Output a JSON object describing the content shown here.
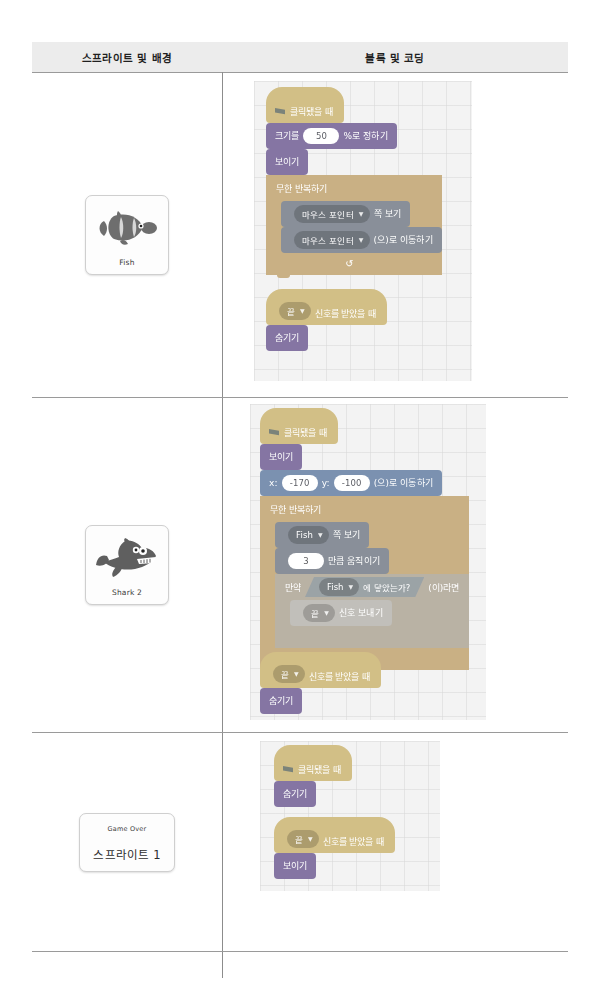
{
  "table": {
    "headers": [
      "스프라이트 및 배경",
      "블록 및 코딩"
    ]
  },
  "palette": {
    "events": "#ffbf00",
    "looks": "#9966ff",
    "motion": "#4c97ff",
    "control": "#ffab19",
    "sensing": "#5cb1d6",
    "flag_green": "#45993d",
    "canvas_bg": "#f3f3f3",
    "header_bg": "#ececec",
    "rule": "#9a9a9a"
  },
  "rows": [
    {
      "sprite": {
        "name": "Fish",
        "thumb_icon": "clownfish-icon"
      },
      "scripts": [
        {
          "id": "fish-main",
          "blocks": [
            {
              "kind": "hat",
              "cat": "events",
              "icon": "green-flag-icon",
              "text": "클릭됐을 때"
            },
            {
              "kind": "stack",
              "cat": "looks",
              "pre": "크기를",
              "input": "50",
              "post": "%로 정하기"
            },
            {
              "kind": "stack",
              "cat": "looks",
              "pre": "보이기"
            },
            {
              "kind": "c",
              "cat": "control",
              "text": "무한 반복하기",
              "arrow": "loop-arrow-icon",
              "children": [
                {
                  "kind": "stack",
                  "cat": "motion",
                  "dropdown": "마우스 포인터",
                  "post": "쪽 보기"
                },
                {
                  "kind": "stack",
                  "cat": "motion",
                  "dropdown": "마우스 포인터",
                  "post": "(으)로 이동하기"
                }
              ]
            }
          ]
        },
        {
          "id": "fish-receive",
          "blocks": [
            {
              "kind": "hat",
              "cat": "events",
              "dropdown": "끝",
              "post": "신호를 받았을 때"
            },
            {
              "kind": "stack",
              "cat": "looks",
              "pre": "숨기기"
            }
          ]
        }
      ]
    },
    {
      "sprite": {
        "name": "Shark 2",
        "thumb_icon": "shark-icon"
      },
      "scripts": [
        {
          "id": "shark-main",
          "blocks": [
            {
              "kind": "hat",
              "cat": "events",
              "icon": "green-flag-icon",
              "text": "클릭됐을 때"
            },
            {
              "kind": "stack",
              "cat": "looks",
              "pre": "보이기"
            },
            {
              "kind": "stack",
              "cat": "motion",
              "pre": "x:",
              "input": "-170",
              "mid": "y:",
              "input2": "-100",
              "post": "(으)로 이동하기"
            },
            {
              "kind": "c",
              "cat": "control",
              "text": "무한 반복하기",
              "arrow": "loop-arrow-icon",
              "children": [
                {
                  "kind": "stack",
                  "cat": "motion",
                  "dropdown": "Fish",
                  "post": "쪽 보기"
                },
                {
                  "kind": "stack",
                  "cat": "motion",
                  "input": "3",
                  "post": "만큼 움직이기"
                },
                {
                  "kind": "c",
                  "cat": "control",
                  "text": "만약",
                  "boolean": {
                    "dropdown": "Fish",
                    "post": "에 닿았는가?"
                  },
                  "tail": "(이)라면",
                  "children": [
                    {
                      "kind": "stack",
                      "cat": "events",
                      "dropdown": "끝",
                      "post": "신호 보내기"
                    }
                  ]
                }
              ]
            }
          ]
        },
        {
          "id": "shark-receive",
          "blocks": [
            {
              "kind": "hat",
              "cat": "events",
              "dropdown": "끝",
              "post": "신호를 받았을 때"
            },
            {
              "kind": "stack",
              "cat": "looks",
              "pre": "숨기기"
            }
          ]
        }
      ]
    },
    {
      "sprite": {
        "name": "스프라이트 1",
        "stage_text": "Game Over"
      },
      "scripts": [
        {
          "id": "gameover-main",
          "blocks": [
            {
              "kind": "hat",
              "cat": "events",
              "icon": "green-flag-icon",
              "text": "클릭됐을 때"
            },
            {
              "kind": "stack",
              "cat": "looks",
              "pre": "숨기기"
            }
          ]
        },
        {
          "id": "gameover-receive",
          "blocks": [
            {
              "kind": "hat",
              "cat": "events",
              "dropdown": "끝",
              "post": "신호를 받았을 때"
            },
            {
              "kind": "stack",
              "cat": "looks",
              "pre": "보이기"
            }
          ]
        }
      ]
    }
  ]
}
